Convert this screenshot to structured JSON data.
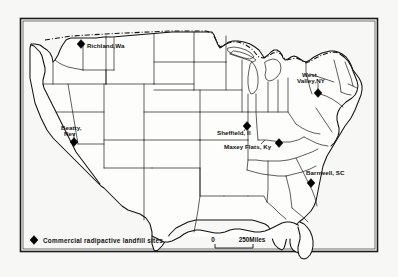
{
  "figure": {
    "type": "map",
    "region": "Contiguous United States",
    "background_color": "#f7f7f5",
    "line_color": "#111111",
    "frame": true
  },
  "sites": [
    {
      "id": "richland",
      "label": "Richland,Wa",
      "label_lines": [
        "Richland,Wa"
      ],
      "marker": "diamond",
      "marker_x": 81,
      "marker_y": 44,
      "label_x": 87,
      "label_y": 48,
      "anchor": "start"
    },
    {
      "id": "beatty",
      "label": "Beatty, Nev",
      "label_lines": [
        "Beatty,",
        "Nev"
      ],
      "marker": "diamond",
      "marker_x": 74,
      "marker_y": 142,
      "label_x": 61,
      "label_y": 130,
      "anchor": "start"
    },
    {
      "id": "sheffield",
      "label": "Sheffield, Il",
      "label_lines": [
        "Sheffield, Il"
      ],
      "marker": "diamond",
      "marker_x": 247,
      "marker_y": 126,
      "label_x": 217,
      "label_y": 135,
      "anchor": "start"
    },
    {
      "id": "maxey-flats",
      "label": "Maxey Flats, Ky",
      "label_lines": [
        "Maxey Flats, Ky"
      ],
      "marker": "diamond",
      "marker_x": 279,
      "marker_y": 143,
      "label_x": 224,
      "label_y": 149,
      "anchor": "start"
    },
    {
      "id": "west-valley",
      "label": "West Valley,NY",
      "label_lines": [
        "West",
        "Valley,NY"
      ],
      "marker": "diamond",
      "marker_x": 318,
      "marker_y": 93,
      "label_x": 297,
      "label_y": 77,
      "anchor": "start"
    },
    {
      "id": "barnwell",
      "label": "Barnwell, SC",
      "label_lines": [
        "Barnwell, SC"
      ],
      "marker": "diamond",
      "marker_x": 311,
      "marker_y": 183,
      "label_x": 306,
      "label_y": 175,
      "anchor": "start"
    }
  ],
  "legend": {
    "marker": "diamond",
    "text": "Commercial radipactive landfill sites",
    "marker_x": 34,
    "marker_y": 240,
    "text_x": 43,
    "text_y": 243
  },
  "scale_bar": {
    "zero_label": "0",
    "max_label": "250Miles",
    "x_start": 215,
    "x_end": 253,
    "y": 243
  }
}
